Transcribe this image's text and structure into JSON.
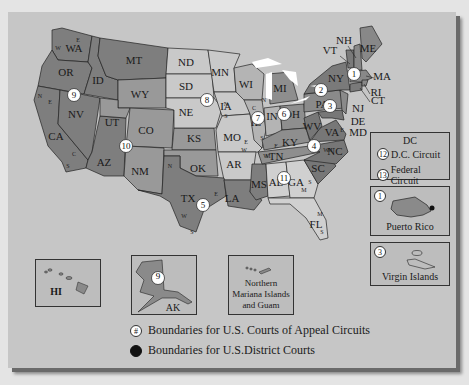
{
  "colors": {
    "background": "#e4e4e4",
    "panel": "#c6c6c6",
    "circuit_dark": "#7e7e7e",
    "circuit_mid": "#999999",
    "circuit_light": "#b4b4b4",
    "circuit_lighter": "#c9c9c9",
    "water": "#ffffff",
    "border": "#222222"
  },
  "states": [
    {
      "abbr": "WA"
    },
    {
      "abbr": "OR"
    },
    {
      "abbr": "CA"
    },
    {
      "abbr": "NV"
    },
    {
      "abbr": "ID"
    },
    {
      "abbr": "MT"
    },
    {
      "abbr": "WY"
    },
    {
      "abbr": "UT"
    },
    {
      "abbr": "AZ"
    },
    {
      "abbr": "CO"
    },
    {
      "abbr": "NM"
    },
    {
      "abbr": "ND"
    },
    {
      "abbr": "SD"
    },
    {
      "abbr": "NE"
    },
    {
      "abbr": "KS"
    },
    {
      "abbr": "OK"
    },
    {
      "abbr": "TX"
    },
    {
      "abbr": "MN"
    },
    {
      "abbr": "IA"
    },
    {
      "abbr": "MO"
    },
    {
      "abbr": "AR"
    },
    {
      "abbr": "LA"
    },
    {
      "abbr": "WI"
    },
    {
      "abbr": "IL"
    },
    {
      "abbr": "MI"
    },
    {
      "abbr": "IN"
    },
    {
      "abbr": "OH"
    },
    {
      "abbr": "KY"
    },
    {
      "abbr": "TN"
    },
    {
      "abbr": "MS"
    },
    {
      "abbr": "AL"
    },
    {
      "abbr": "GA"
    },
    {
      "abbr": "FL"
    },
    {
      "abbr": "SC"
    },
    {
      "abbr": "NC"
    },
    {
      "abbr": "VA"
    },
    {
      "abbr": "WV"
    },
    {
      "abbr": "PA"
    },
    {
      "abbr": "NY"
    },
    {
      "abbr": "VT"
    },
    {
      "abbr": "NH"
    },
    {
      "abbr": "ME"
    },
    {
      "abbr": "MA"
    },
    {
      "abbr": "RI"
    },
    {
      "abbr": "CT"
    },
    {
      "abbr": "NJ"
    },
    {
      "abbr": "DE"
    },
    {
      "abbr": "MD"
    }
  ],
  "circuits": [
    "1",
    "2",
    "3",
    "4",
    "5",
    "6",
    "7",
    "8",
    "9",
    "10",
    "11",
    "12",
    "13"
  ],
  "district_letters": {
    "E": "E",
    "W": "W",
    "N": "N",
    "S": "S",
    "C": "C",
    "M": "M"
  },
  "insets": {
    "dc": {
      "title": "DC",
      "rows": [
        {
          "num": "12",
          "label": "D.C. Circuit"
        },
        {
          "num": "13",
          "label": "Federal Circuit"
        }
      ]
    },
    "puerto_rico": {
      "num": "1",
      "label": "Puerto Rico"
    },
    "virgin_islands": {
      "num": "3",
      "label": "Virgin Islands"
    },
    "hawaii": {
      "label": "HI"
    },
    "alaska": {
      "num": "9",
      "label": "AK"
    },
    "mariana": {
      "line1": "Northern",
      "line2": "Mariana Islands",
      "line3": "and Guam"
    }
  },
  "legend": {
    "appeal": {
      "symbol": "#",
      "label": "Boundaries for U.S. Courts of Appeal Circuits"
    },
    "district": {
      "label": "Boundaries for U.S.District Courts"
    }
  }
}
